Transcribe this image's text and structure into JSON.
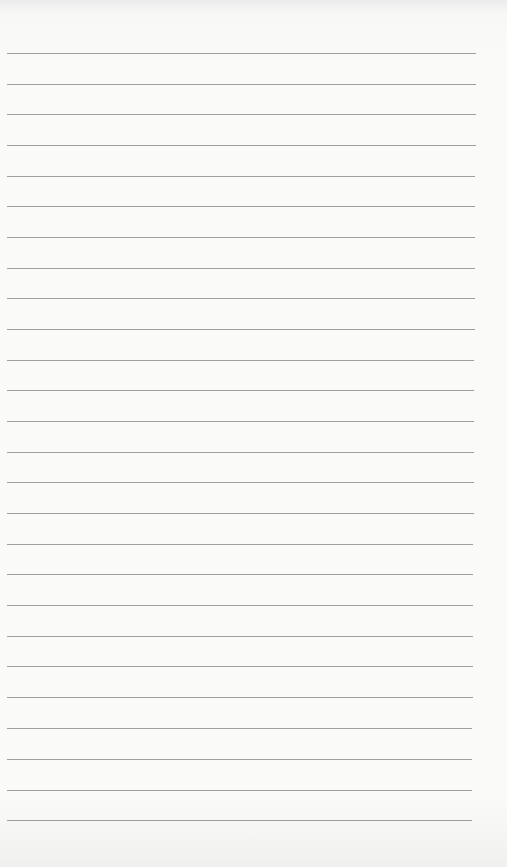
{
  "page": {
    "type": "lined-paper",
    "background_color": "#f8f8f7",
    "rule_color": "#8d8d8d",
    "rule_count": 26,
    "rules_y": [
      53,
      84,
      114,
      145,
      176,
      206,
      237,
      268,
      298,
      329,
      360,
      390,
      421,
      452,
      482,
      513,
      544,
      574,
      605,
      636,
      666,
      697,
      728,
      759,
      790,
      820
    ]
  }
}
